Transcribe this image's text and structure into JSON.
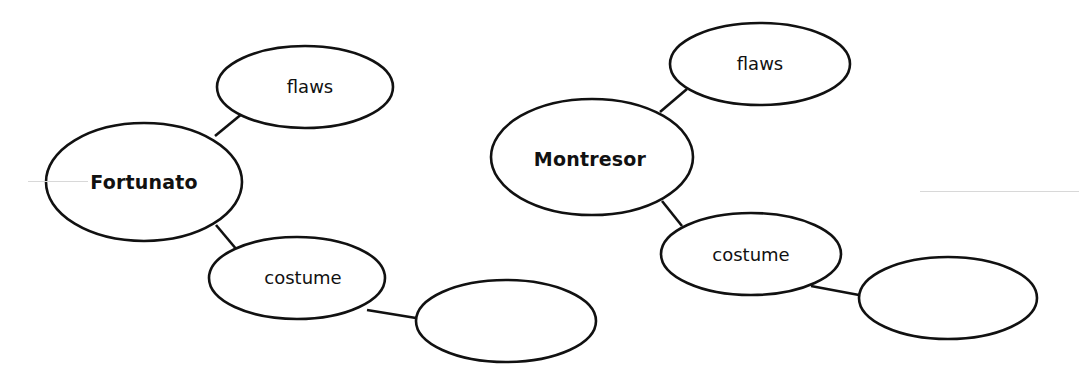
{
  "diagram": {
    "type": "concept-web",
    "stroke_color": "#111111",
    "background": "#ffffff",
    "webs": [
      {
        "center": {
          "label": "Fortunato",
          "bold": true
        },
        "branches": [
          {
            "label": "flaws"
          },
          {
            "label": "costume",
            "children": [
              {
                "label": ""
              }
            ]
          }
        ]
      },
      {
        "center": {
          "label": "Montresor",
          "bold": true
        },
        "branches": [
          {
            "label": "flaws"
          },
          {
            "label": "costume",
            "children": [
              {
                "label": ""
              }
            ]
          }
        ]
      }
    ]
  },
  "labels": {
    "left_center": "Fortunato",
    "left_flaws": "flaws",
    "left_costume": "costume",
    "left_blank": "",
    "right_center": "Montresor",
    "right_flaws": "flaws",
    "right_costume": "costume",
    "right_blank": ""
  }
}
